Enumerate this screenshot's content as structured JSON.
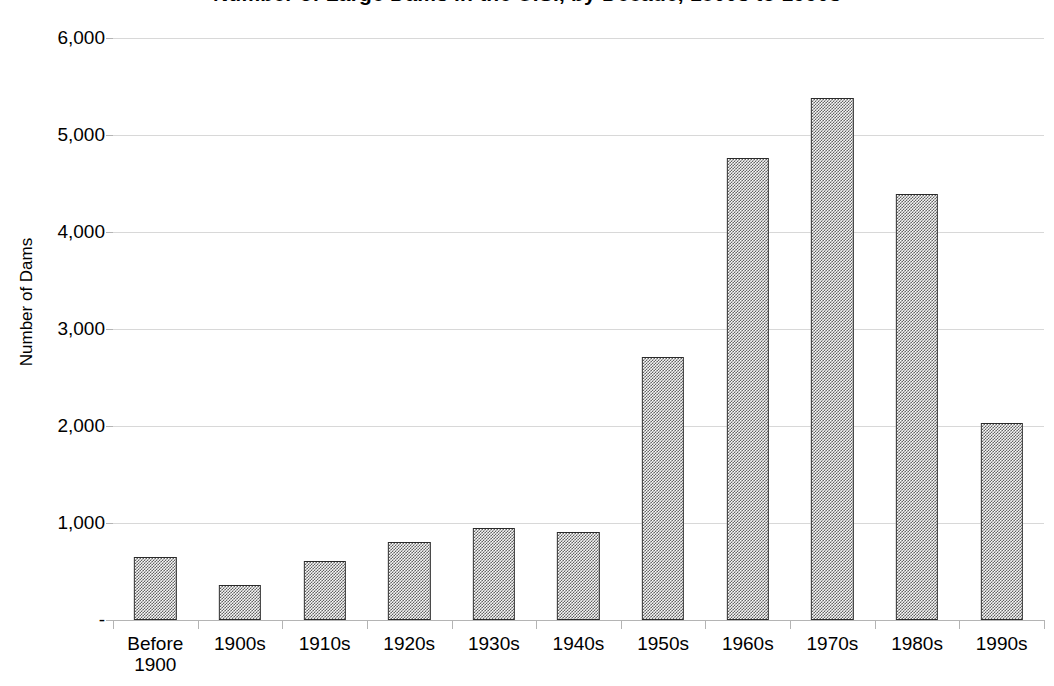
{
  "chart_data": {
    "type": "bar",
    "title": "Number of Large Dams in the U.S., by Decade, 1800s to 1990s",
    "title_visible_note": "title clipped at top edge of screenshot",
    "xlabel": "",
    "ylabel": "Number of Dams",
    "categories": [
      "Before\n1900",
      "1900s",
      "1910s",
      "1920s",
      "1930s",
      "1940s",
      "1950s",
      "1960s",
      "1970s",
      "1980s",
      "1990s"
    ],
    "values": [
      650,
      360,
      610,
      805,
      950,
      910,
      2710,
      4760,
      5380,
      4390,
      2030
    ],
    "ylim": [
      0,
      6000
    ],
    "y_ticks": [
      0,
      1000,
      2000,
      3000,
      4000,
      5000,
      6000
    ],
    "y_tick_labels": [
      "-",
      "1,000",
      "2,000",
      "3,000",
      "4,000",
      "5,000",
      "6,000"
    ],
    "grid": true,
    "legend": false,
    "series": [
      {
        "name": "Number of Dams",
        "values": [
          650,
          360,
          610,
          805,
          950,
          910,
          2710,
          4760,
          5380,
          4390,
          2030
        ]
      }
    ]
  },
  "colors": {
    "bar_fill": "#7a7a7a",
    "bar_border": "#2a2a2a",
    "gridline": "#d8d8d8",
    "axis_line": "#b4b4b4",
    "text": "#000000",
    "background": "#ffffff"
  }
}
